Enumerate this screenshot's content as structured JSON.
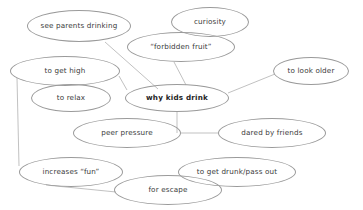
{
  "diagram": {
    "title": "why kids drink",
    "type": "concept-map",
    "style": {
      "background": "#ffffff",
      "node_stroke": "#9a9a9a",
      "edge_stroke": "#a6a6a6",
      "text_color": "#3a3a3a",
      "central_text_color": "#1d1d1d"
    },
    "nodes": [
      {
        "id": "parents",
        "label": "see parents drinking",
        "cx": 79,
        "cy": 26,
        "rx": 52,
        "ry": 16,
        "central": false
      },
      {
        "id": "curiosity",
        "label": "curiosity",
        "cx": 210,
        "cy": 22,
        "rx": 39,
        "ry": 15,
        "central": false
      },
      {
        "id": "forbidden",
        "label": "“forbidden fruit”",
        "cx": 181,
        "cy": 47,
        "rx": 54,
        "ry": 15,
        "central": false
      },
      {
        "id": "gethigh",
        "label": "to get high",
        "cx": 65,
        "cy": 71,
        "rx": 55,
        "ry": 15,
        "central": false
      },
      {
        "id": "relax",
        "label": "to relax",
        "cx": 71,
        "cy": 98,
        "rx": 40,
        "ry": 14,
        "central": false
      },
      {
        "id": "lookolder",
        "label": "to look older",
        "cx": 311,
        "cy": 71,
        "rx": 38,
        "ry": 14,
        "central": false
      },
      {
        "id": "central",
        "label": "why kids drink",
        "cx": 177,
        "cy": 98,
        "rx": 52,
        "ry": 14,
        "central": true
      },
      {
        "id": "peer",
        "label": "peer pressure",
        "cx": 127,
        "cy": 133,
        "rx": 54,
        "ry": 15,
        "central": false
      },
      {
        "id": "dared",
        "label": "dared by friends",
        "cx": 272,
        "cy": 133,
        "rx": 54,
        "ry": 15,
        "central": false
      },
      {
        "id": "fun",
        "label": "increases “fun”",
        "cx": 71,
        "cy": 172,
        "rx": 52,
        "ry": 15,
        "central": false
      },
      {
        "id": "drunk",
        "label": "to get drunk/pass out",
        "cx": 237,
        "cy": 172,
        "rx": 59,
        "ry": 15,
        "central": false
      },
      {
        "id": "escape",
        "label": "for escape",
        "cx": 168,
        "cy": 190,
        "rx": 54,
        "ry": 15,
        "central": false
      }
    ],
    "edges": [
      {
        "from": "parents",
        "to": "central",
        "path": "M 105,42 L 158,89"
      },
      {
        "from": "forbidden",
        "to": "central",
        "path": "M 174,62 L 186,85"
      },
      {
        "from": "gethigh",
        "to": "central",
        "path": "M 119,76 L 127,90"
      },
      {
        "from": "central",
        "to": "lookolder",
        "path": "M 228,93 L 275,74"
      },
      {
        "from": "central",
        "to": "junction",
        "path": "M 177,112 L 177,133"
      },
      {
        "from": "peer",
        "to": "dared",
        "path": "M 181,133 L 218,133"
      },
      {
        "from": "gethigh",
        "to": "fun",
        "path": "M 17,78 L 19,166"
      },
      {
        "from": "fun",
        "to": "escape",
        "path": "M 46,185 L 116,192"
      }
    ]
  }
}
